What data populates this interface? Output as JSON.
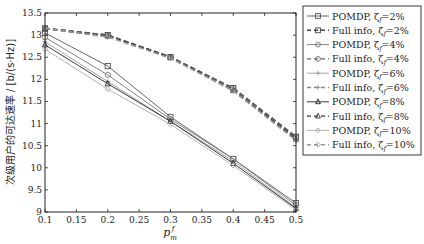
{
  "chart_data": {
    "type": "line",
    "title": "",
    "xlabel": "p_m^f",
    "ylabel": "次级用户的可达速率 / [b/(s·Hz)]",
    "xlim": [
      0.1,
      0.5
    ],
    "ylim": [
      9,
      13.5
    ],
    "xticks": [
      "0.1",
      "0.15",
      "0.2",
      "0.25",
      "0.3",
      "0.35",
      "0.4",
      "0.45",
      "0.5"
    ],
    "yticks": [
      "9",
      "9.5",
      "10",
      "10.5",
      "11",
      "11.5",
      "12",
      "12.5",
      "13",
      "13.5"
    ],
    "grid": false,
    "legend_position": "right-outside-top",
    "x": [
      0.1,
      0.2,
      0.3,
      0.4,
      0.5
    ],
    "series": [
      {
        "name": "POMDP, ζf=2%",
        "style": "solid",
        "marker": "square",
        "color": "#555555",
        "values": [
          13.05,
          12.3,
          11.15,
          10.2,
          9.2
        ]
      },
      {
        "name": "Full info, ζf=2%",
        "style": "dashed",
        "marker": "square",
        "color": "#444444",
        "values": [
          13.15,
          13.0,
          12.5,
          11.8,
          10.7
        ]
      },
      {
        "name": "POMDP, ζf=4%",
        "style": "solid",
        "marker": "circle",
        "color": "#777777",
        "values": [
          12.95,
          12.1,
          11.1,
          10.2,
          9.15
        ]
      },
      {
        "name": "Full info, ζf=4%",
        "style": "dashed",
        "marker": "circle",
        "color": "#666666",
        "values": [
          13.15,
          13.0,
          12.5,
          11.78,
          10.68
        ]
      },
      {
        "name": "POMDP, ζf=6%",
        "style": "solid",
        "marker": "star",
        "color": "#999999",
        "values": [
          12.85,
          11.95,
          11.05,
          10.15,
          9.1
        ]
      },
      {
        "name": "Full info, ζf=6%",
        "style": "dashed",
        "marker": "star",
        "color": "#888888",
        "values": [
          13.15,
          12.98,
          12.5,
          11.76,
          10.66
        ]
      },
      {
        "name": "POMDP, ζf=8%",
        "style": "solid",
        "marker": "triangle",
        "color": "#222222",
        "values": [
          12.78,
          11.9,
          11.05,
          10.1,
          9.08
        ]
      },
      {
        "name": "Full info, ζf=8%",
        "style": "dashed",
        "marker": "triangle",
        "color": "#333333",
        "values": [
          13.15,
          12.98,
          12.5,
          11.75,
          10.65
        ]
      },
      {
        "name": "POMDP, ζf=10%",
        "style": "solid",
        "marker": "diamond",
        "color": "#aaaaaa",
        "values": [
          12.68,
          11.78,
          10.98,
          10.05,
          9.05
        ]
      },
      {
        "name": "Full info, ζf=10%",
        "style": "dashed",
        "marker": "diamond",
        "color": "#999999",
        "values": [
          13.15,
          12.96,
          12.48,
          11.74,
          10.62
        ]
      }
    ]
  },
  "legend": {
    "items": [
      {
        "label": "POMDP, ζ",
        "sub": "f",
        "pct": "=2%"
      },
      {
        "label": "Full info, ζ",
        "sub": "f",
        "pct": "=2%"
      },
      {
        "label": "POMDP, ζ",
        "sub": "f",
        "pct": "=4%"
      },
      {
        "label": "Full info, ζ",
        "sub": "f",
        "pct": "=4%"
      },
      {
        "label": "POMDP, ζ",
        "sub": "f",
        "pct": "=6%"
      },
      {
        "label": "Full info, ζ",
        "sub": "f",
        "pct": "=6%"
      },
      {
        "label": "POMDP, ζ",
        "sub": "f",
        "pct": "=8%"
      },
      {
        "label": "Full info, ζ",
        "sub": "f",
        "pct": "=8%"
      },
      {
        "label": "POMDP, ζ",
        "sub": "f",
        "pct": "=10%"
      },
      {
        "label": "Full info, ζ",
        "sub": "f",
        "pct": "=10%"
      }
    ]
  },
  "axes": {
    "xlabel_main": "p",
    "xlabel_sup": "f",
    "xlabel_sub": "m",
    "ylabel": "次级用户的可达速率 / [b/(s·Hz)]"
  }
}
